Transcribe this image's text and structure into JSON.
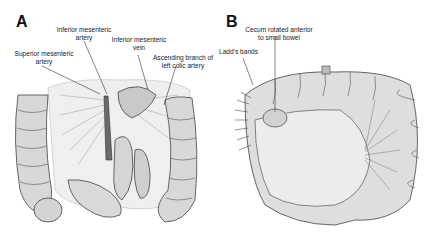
{
  "figure": {
    "panels": [
      {
        "id": "A",
        "letter": "A",
        "labels": {
          "sma": "Superior mesenteric\nartery",
          "ima": "Inferior mesenteric\nartery",
          "imv": "Inferior mesenteric\nvein",
          "lca": "Ascending branch of\nleft colic artery"
        }
      },
      {
        "id": "B",
        "letter": "B",
        "labels": {
          "cecum": "Cecum rotated anterior\nto small bowel",
          "ladd": "Ladd's bands"
        }
      }
    ],
    "colors": {
      "ink": "#3a3a3a",
      "bowel_fill": "#d9d9d9",
      "mesentery_fill": "#ececec",
      "background": "#ffffff"
    }
  }
}
